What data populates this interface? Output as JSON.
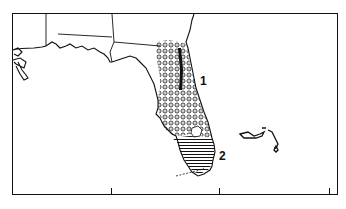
{
  "map": {
    "region_labels": [
      {
        "id": "1",
        "text": "1",
        "pattern": "dotted-circles"
      },
      {
        "id": "2",
        "text": "2",
        "pattern": "horizontal-lines"
      }
    ],
    "frame": {
      "ticks_bottom": 3
    },
    "colors": {
      "ink": "#111111",
      "background": "#ffffff"
    }
  },
  "caption": {
    "text": ""
  }
}
